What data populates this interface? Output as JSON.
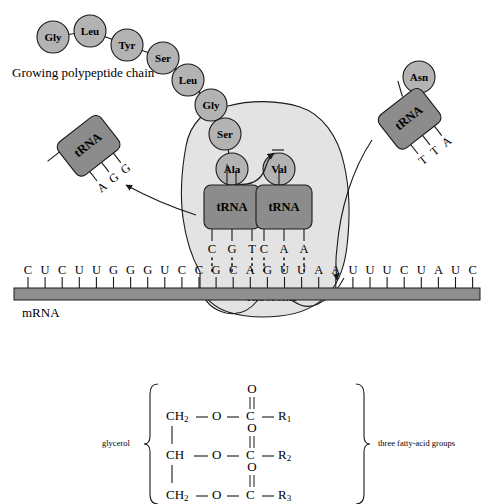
{
  "figure": {
    "top_panel": {
      "labels": {
        "growing_chain": "Growing polypeptide chain",
        "mrna": "mRNA",
        "ribosome": "Ribosome"
      },
      "polypeptide_chain": [
        {
          "name": "Gly",
          "x": 53,
          "y": 37
        },
        {
          "name": "Leu",
          "x": 90,
          "y": 31
        },
        {
          "name": "Tyr",
          "x": 127,
          "y": 45
        },
        {
          "name": "Ser",
          "x": 163,
          "y": 58
        },
        {
          "name": "Leu",
          "x": 188,
          "y": 80
        },
        {
          "name": "Gly",
          "x": 211,
          "y": 105
        },
        {
          "name": "Ser",
          "x": 225,
          "y": 134
        },
        {
          "name": "Ala",
          "x": 232,
          "y": 169
        }
      ],
      "site_amino_acid": {
        "name": "Val",
        "x": 279,
        "y": 169
      },
      "bound_trnas": [
        {
          "label": "tRNA",
          "x": 204,
          "y": 186,
          "w": 56,
          "h": 44,
          "anticodon": [
            "C",
            "G",
            "T"
          ]
        },
        {
          "label": "tRNA",
          "x": 256,
          "y": 186,
          "w": 56,
          "h": 44,
          "anticodon": [
            "C",
            "A",
            "A"
          ]
        }
      ],
      "exiting_trna": {
        "label": "tRNA",
        "anticodon": [
          "A",
          "G",
          "G"
        ],
        "x": 88,
        "y": 145,
        "rotation": -38
      },
      "incoming_trna": {
        "label": "tRNA",
        "amino_acid": "Asn",
        "anticodon": [
          "T",
          "T",
          "A"
        ],
        "x": 409,
        "y": 113,
        "rotation": -38
      },
      "mrna_sequence": [
        "C",
        "U",
        "C",
        "U",
        "U",
        "G",
        "G",
        "G",
        "U",
        "C",
        "C",
        "G",
        "C",
        "A",
        "G",
        "U",
        "U",
        "A",
        "A",
        "U",
        "U",
        "U",
        "C",
        "U",
        "A",
        "U",
        "C"
      ],
      "codon_pairing": {
        "anticodon_row": [
          "C",
          "G",
          "T",
          "C",
          "A",
          "A"
        ],
        "codon_row": [
          "G",
          "C",
          "A",
          "G",
          "U",
          "U"
        ]
      }
    },
    "bottom_panel": {
      "left_label": "glycerol",
      "right_label": "three fatty-acid groups",
      "rows": [
        {
          "backbone": "CH",
          "backbone_sub": "2",
          "o": "O",
          "c": "C",
          "carbonyl": "O",
          "r": "R",
          "r_sub": "1"
        },
        {
          "backbone": "CH",
          "backbone_sub": "",
          "o": "O",
          "c": "C",
          "carbonyl": "O",
          "r": "R",
          "r_sub": "2"
        },
        {
          "backbone": "CH",
          "backbone_sub": "2",
          "o": "O",
          "c": "C",
          "carbonyl": "O",
          "r": "R",
          "r_sub": "3"
        }
      ],
      "bond": "—"
    },
    "colors": {
      "amino_acid_fill": "#b3b3b3",
      "trna_fill": "#8c8c8c",
      "ribosome_fill": "#e3e3e3",
      "mrna_bar": "#8f8f8f",
      "outline": "#1a1a1a"
    }
  }
}
